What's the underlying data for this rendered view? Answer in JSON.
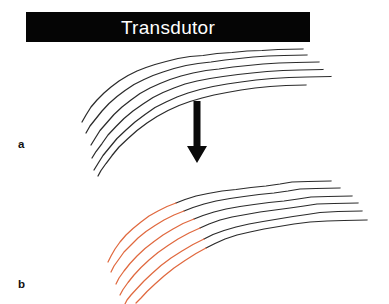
{
  "figure": {
    "background_color": "#ffffff",
    "width": 389,
    "height": 304,
    "caption_labels": {
      "panel_a": "a",
      "panel_b": "b"
    }
  },
  "transducer_bar": {
    "label": "Transdutor",
    "fill_color": "#050505",
    "text_color": "#ffffff",
    "x": 26,
    "y": 12,
    "width": 284,
    "height": 30
  },
  "arrow": {
    "name": "downward-arrow",
    "color": "#0a0a0a",
    "x": 197,
    "y_top": 101,
    "y_bottom": 163
  },
  "colors": {
    "fiber_dark": "#2b2b2b",
    "fiber_highlight": "#e0693f",
    "background": "#ffffff",
    "bar_fill": "#050505",
    "bar_text": "#ffffff"
  },
  "panel_a": {
    "label": "a",
    "description": "Muscle fiber lines, all dark",
    "fiber_count": 6,
    "fibers": [
      {
        "index": 0,
        "color": "#2b2b2b",
        "path": "M 303 49 L 278 49.5 L 262 50.5 L 247 51 L 232 52.5 L 217 53.5 L 203 55.5 L 190 56.5 L 178 58.5 L 166 61.5 L 155 64.5 L 146 67.5 L 137 71 L 128 75.5 L 119 81 L 111 87 L 104 93 L 97 100 L 91 107 L 86 115 L 82 122"
      },
      {
        "index": 1,
        "color": "#2b2b2b",
        "path": "M 307 55 L 284 55.5 L 268 56 L 253 57 L 239 58.5 L 225 60 L 211 62 L 198 63.5 L 186 65.5 L 174 68.5 L 163 72 L 153 75.5 L 144 79.5 L 134 84.5 L 125 90.5 L 117 96.5 L 109 103.5 L 102 111 L 96 118.5 L 90 126 L 86 133"
      },
      {
        "index": 2,
        "color": "#2b2b2b",
        "path": "M 319 62 L 296 62.5 L 279 63 L 263 64 L 248 65.5 L 233 67 L 219 69 L 206 70.5 L 193 73 L 181 76 L 170 79.5 L 160 83.5 L 150 88 L 140 93.5 L 131 100 L 122 107 L 114 114.5 L 107 122.5 L 100 130.5 L 95 138.5 L 91 145"
      },
      {
        "index": 3,
        "color": "#2b2b2b",
        "path": "M 323 69.5 L 300 70 L 283 70.5 L 267 71.5 L 252 73 L 238 74.5 L 223 76.5 L 210 78.5 L 197 81 L 185 84 L 174 88 L 163 92.5 L 153 97.5 L 143 104 L 133 111 L 124 118.5 L 116 126.5 L 108 135 L 102 143.5 L 96 151.5 L 92 158"
      },
      {
        "index": 4,
        "color": "#2b2b2b",
        "path": "M 331 76.5 L 307 77 L 289 77.5 L 272 78.5 L 256 80 L 241 82 L 227 84 L 213 86.5 L 200 89.5 L 188 93 L 177 97 L 166 102 L 155 107.5 L 145 114.5 L 135 122 L 126 130 L 117 138.5 L 110 147 L 103 155.5 L 98 163.5 L 94 170"
      },
      {
        "index": 5,
        "color": "#2b2b2b",
        "path": "M 306 85 L 286 85.5 L 270 86.5 L 255 88 L 241 90 L 227 92.5 L 214 95 L 202 98 L 190 101.5 L 179 105.5 L 168 110.5 L 157 116.5 L 147 123 L 137 130.5 L 128 138.5 L 119 147 L 112 155.5 L 106 163.5 L 101 170.5 L 98 176"
      }
    ]
  },
  "panel_b": {
    "label": "b",
    "description": "Muscle fiber lines with proximal segments highlighted in orange",
    "fiber_count": 6,
    "fibers": [
      {
        "index": 0,
        "dark_color": "#2b2b2b",
        "highlight_color": "#e0693f",
        "dark_path": "M 331 181 L 308 181.5 L 292 182 L 280 184 L 266 186 L 251 187.5 L 236 189.5 L 222 191 L 208 193.5 L 196 196 L 185 199.5 L 176 203",
        "highlight_path": "M 176 203 L 167 206.5 L 158 211 L 149 216 L 141 222 L 133 228.5 L 126 235 L 120 242 L 115 249 L 111 256 L 108 262"
      },
      {
        "index": 1,
        "dark_color": "#2b2b2b",
        "highlight_color": "#e0693f",
        "dark_path": "M 340 188 L 316 188.5 L 300 189 L 288 191 L 274 193 L 259 194.5 L 244 196.5 L 230 198.5 L 216 201 L 204 204 L 193 207.5 L 184 211",
        "highlight_path": "M 184 211 L 174 215 L 164 220 L 155 225.5 L 146 231.5 L 138 238 L 131 245 L 124 252 L 119 259 L 114 266 L 111 272"
      },
      {
        "index": 2,
        "dark_color": "#2b2b2b",
        "highlight_color": "#e0693f",
        "dark_path": "M 352 196 L 328 196.5 L 311 197 L 298 199 L 284 201 L 269 202.5 L 254 204.5 L 240 206.5 L 226 209 L 214 212 L 203 215.5 L 194 219",
        "highlight_path": "M 194 219 L 183 223.5 L 173 229 L 163 235 L 154 241.5 L 145 248.5 L 137 256 L 130 263.5 L 124 271 L 119 278 L 116 284"
      },
      {
        "index": 3,
        "dark_color": "#2b2b2b",
        "highlight_color": "#e0693f",
        "dark_path": "M 358 203 L 334 203.5 L 317 204 L 304 206 L 290 208 L 275 210 L 260 212 L 246 214.5 L 232 217 L 220 220 L 209 224 L 200 228",
        "highlight_path": "M 200 228 L 189 233 L 178 239 L 168 245.5 L 158 252.5 L 149 260 L 141 267.5 L 134 275 L 128 282.5 L 123 289.5 L 120 295"
      },
      {
        "index": 4,
        "dark_color": "#2b2b2b",
        "highlight_color": "#e0693f",
        "dark_path": "M 362 211 L 338 211.5 L 320 212.5 L 307 214.5 L 293 216.5 L 278 219 L 263 221.5 L 249 224 L 236 227 L 224 230.5 L 213 234.5 L 204 239",
        "highlight_path": "M 204 239 L 193 244.5 L 182 251 L 171 258 L 161 265.5 L 152 273.5 L 144 281 L 137 288.5 L 131 295 L 127 300 L 125 304"
      },
      {
        "index": 5,
        "dark_color": "#2b2b2b",
        "highlight_color": "#e0693f",
        "dark_path": "M 367 220 L 344 220.5 L 327 221 L 310 222 L 294 224 L 279 226.5 L 264 229 L 250 232 L 237 235 L 225 239 L 215 243.5 L 206 248",
        "highlight_path": "M 206 248 L 196 253.5 L 185 260.5 L 174 268 L 164 276 L 155 284 L 147 291.5 L 141 298 L 136 303"
      }
    ]
  }
}
